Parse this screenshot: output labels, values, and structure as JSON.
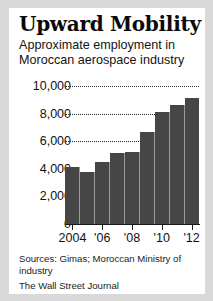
{
  "card": {
    "title": "Upward Mobility",
    "subtitle": "Approximate employment in Moroccan aerospace industry",
    "sources": "Sources: Gimas; Moroccan Ministry of industry",
    "publisher": "The Wall Street Journal",
    "bar_color": "#464646",
    "background": "#ffffff",
    "page_background": "#d9d9d9"
  },
  "chart_data": {
    "type": "bar",
    "title": "Upward Mobility",
    "subtitle": "Approximate employment in Moroccan aerospace industry",
    "xlabel": "",
    "ylabel": "",
    "categories": [
      "2004",
      "2005",
      "2006",
      "2007",
      "2008",
      "2009",
      "2010",
      "2011",
      "2012"
    ],
    "tick_labels": [
      "2004",
      "'06",
      "'08",
      "'10",
      "'12"
    ],
    "tick_categories": [
      "2004",
      "2006",
      "2008",
      "2010",
      "2012"
    ],
    "values": [
      4150,
      3750,
      4500,
      5150,
      5200,
      6700,
      8100,
      8650,
      9150
    ],
    "ylim": [
      0,
      10000
    ],
    "yticks": [
      0,
      2000,
      4000,
      6000,
      8000,
      10000
    ],
    "ytick_labels": [
      "0",
      "2,000",
      "4,000",
      "6,000",
      "8,000",
      "10,000"
    ],
    "gridlines": [
      6000,
      8000,
      10000
    ],
    "grid": true,
    "legend": null
  }
}
